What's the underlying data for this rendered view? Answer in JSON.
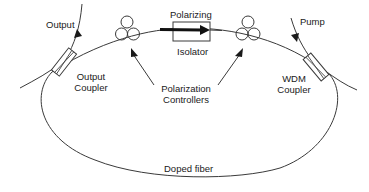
{
  "diagram": {
    "type": "fiber ring laser schematic",
    "colors": {
      "line": "#3a3a3a",
      "text": "#1a1a1a",
      "background": "#ffffff"
    },
    "labels": {
      "output": "Output",
      "output_coupler_line1": "Output",
      "output_coupler_line2": "Coupler",
      "polarizing": "Polarizing",
      "isolator": "Isolator",
      "pump": "Pump",
      "wdm_line1": "WDM",
      "wdm_line2": "Coupler",
      "polarization_controllers_line1": "Polarization",
      "polarization_controllers_line2": "Controllers",
      "doped_fiber": "Doped fiber"
    },
    "components": [
      {
        "id": "output-coupler",
        "label": "Output Coupler"
      },
      {
        "id": "polarization-controller-left",
        "label": "Polarization Controller"
      },
      {
        "id": "polarizing-isolator",
        "label": "Polarizing Isolator"
      },
      {
        "id": "polarization-controller-right",
        "label": "Polarization Controller"
      },
      {
        "id": "wdm-coupler",
        "label": "WDM Coupler"
      },
      {
        "id": "doped-fiber-ring",
        "label": "Doped fiber"
      }
    ]
  }
}
